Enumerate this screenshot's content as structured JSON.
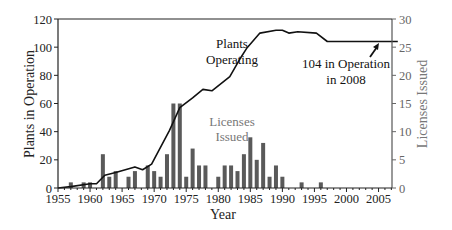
{
  "chart_data": {
    "type": "bar+line",
    "title": "",
    "xlabel": "Year",
    "ylabel_left": "Plants in Operation",
    "ylabel_right": "Licenses Issued",
    "xlim": [
      1955,
      2008
    ],
    "ylim_left": [
      0,
      120
    ],
    "ylim_right": [
      0,
      30
    ],
    "x_ticks": [
      1955,
      1960,
      1965,
      1970,
      1975,
      1980,
      1985,
      1990,
      1995,
      2000,
      2005
    ],
    "y_ticks_left": [
      0,
      20,
      40,
      60,
      80,
      100,
      120
    ],
    "y_ticks_right": [
      0,
      5,
      10,
      15,
      20,
      25,
      30
    ],
    "grid": false,
    "series": [
      {
        "name": "Licenses Issued",
        "type": "bar",
        "axis": "right",
        "color": "#5a5a5a",
        "x": [
          1957,
          1959,
          1960,
          1962,
          1963,
          1964,
          1966,
          1967,
          1969,
          1970,
          1971,
          1972,
          1973,
          1974,
          1975,
          1976,
          1977,
          1978,
          1980,
          1981,
          1982,
          1983,
          1984,
          1985,
          1986,
          1987,
          1988,
          1989,
          1990,
          1993,
          1996
        ],
        "values": [
          1,
          1,
          1,
          6,
          2,
          3,
          2,
          3,
          4,
          3,
          2,
          6,
          15,
          15,
          2,
          7,
          4,
          4,
          2,
          4,
          4,
          3,
          6,
          9,
          5,
          8,
          2,
          4,
          2,
          1,
          1
        ]
      },
      {
        "name": "Plants Operating",
        "type": "line",
        "axis": "left",
        "color": "#111111",
        "x": [
          1955,
          1957,
          1960,
          1961,
          1962.3,
          1964,
          1967,
          1968.2,
          1969.6,
          1972.4,
          1974,
          1976,
          1977.6,
          1979,
          1981.8,
          1983.3,
          1984.4,
          1986.5,
          1989,
          1990,
          1991,
          1992.4,
          1995.3,
          1997,
          2008
        ],
        "values": [
          0,
          1,
          3,
          3,
          9,
          11,
          15,
          13,
          17,
          41,
          57,
          64,
          70,
          69,
          79,
          91,
          99,
          110,
          112,
          112,
          110,
          111,
          110,
          104,
          104
        ]
      }
    ],
    "annotations": [
      {
        "text_lines": [
          "Plants",
          "Operating"
        ],
        "x": 1983,
        "y": 103,
        "color": "#111111"
      },
      {
        "text_lines": [
          "Licenses",
          "Issued"
        ],
        "x": 1983,
        "y": 48,
        "color": "#777777"
      },
      {
        "text_lines": [
          "104 in Operation",
          "in 2008"
        ],
        "x": 2000,
        "y": 83,
        "arrow_to": [
          2004,
          104
        ],
        "color": "#111111"
      }
    ]
  }
}
